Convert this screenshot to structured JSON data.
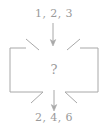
{
  "diagram": {
    "type": "function-machine",
    "title": "",
    "input": {
      "label": "1, 2, 3",
      "values": [
        1,
        2,
        3
      ],
      "icon": "arrow-down-icon",
      "position": "top"
    },
    "process": {
      "label": "?",
      "shape": "notched-box",
      "position": "center"
    },
    "output": {
      "label": "2, 4, 6",
      "values": [
        2,
        4,
        6
      ],
      "icon": "arrow-down-icon",
      "position": "bottom"
    },
    "colors": {
      "stroke": "#a8a8a8",
      "text": "#9a9a9a",
      "background": "#ffffff"
    }
  }
}
